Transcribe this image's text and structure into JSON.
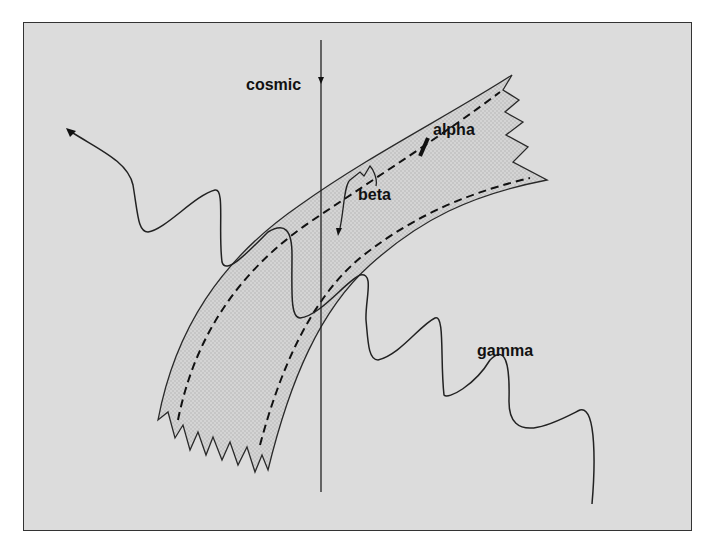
{
  "diagram": {
    "type": "schematic",
    "background_color": "#dcdcdc",
    "band_fill_color": "#c4c4c4",
    "line_color": "#222222",
    "labels": {
      "cosmic": "cosmic",
      "alpha": "alpha",
      "beta": "beta",
      "gamma": "gamma"
    },
    "elements": [
      {
        "id": "cosmic",
        "kind": "vertical straight line with arrowhead pointing down near top",
        "label": "cosmic"
      },
      {
        "id": "band",
        "kind": "curved shaded band with dashed inner boundaries and jagged ends",
        "label": ""
      },
      {
        "id": "alpha",
        "kind": "short thick track inside band",
        "label": "alpha"
      },
      {
        "id": "beta",
        "kind": "short jagged track ending in arrowhead inside band",
        "label": "beta"
      },
      {
        "id": "wavy-track",
        "kind": "wavy line from upper-left (arrowhead) through band",
        "label": ""
      },
      {
        "id": "gamma",
        "kind": "wavy line exiting band to lower-right",
        "label": "gamma"
      }
    ]
  }
}
